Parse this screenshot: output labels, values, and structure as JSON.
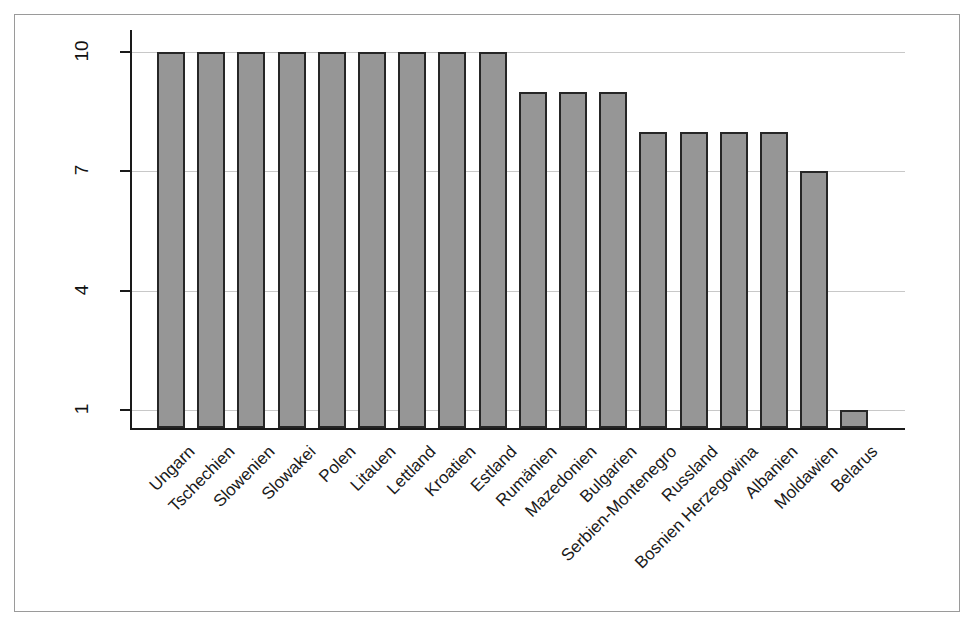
{
  "chart_data": {
    "type": "bar",
    "title": "",
    "subtitle": "",
    "xlabel": "",
    "ylabel": "",
    "ylim": [
      0.4,
      10.6
    ],
    "yticks": [
      1,
      4,
      7,
      10
    ],
    "ytick_labels": [
      "1",
      "4",
      "7",
      "10"
    ],
    "grid": true,
    "grid_axis": "y",
    "legend": false,
    "legend_position": "none",
    "bar_color": "#969696",
    "bar_edge_color": "#262626",
    "gridline_color": "#c8c8c8",
    "axis_color": "#1a1a1a",
    "background_color": "#ffffff",
    "frame_color": "#9a9a9a",
    "xtick_rotation": 45,
    "ytick_rotation": 90,
    "categories": [
      "Ungarn",
      "Tschechien",
      "Slowenien",
      "Slowakei",
      "Polen",
      "Litauen",
      "Lettland",
      "Kroatien",
      "Estland",
      "Rumänien",
      "Mazedonien",
      "Bulgarien",
      "Serbien-Montenegro",
      "Russland",
      "Bosnien Herzegowina",
      "Albanien",
      "Moldawien",
      "Belarus"
    ],
    "values": [
      10,
      10,
      10,
      10,
      10,
      10,
      10,
      10,
      10,
      9,
      9,
      9,
      8,
      8,
      8,
      8,
      7,
      1
    ]
  }
}
